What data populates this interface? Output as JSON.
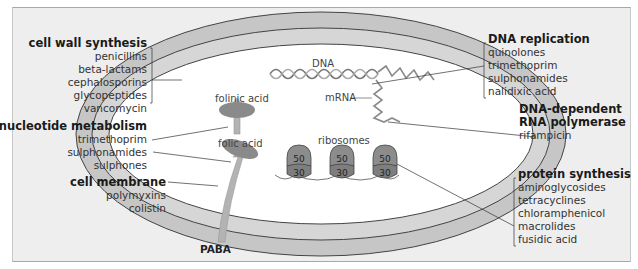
{
  "diagram": {
    "cell_labels": {
      "dna": "DNA",
      "mrna": "mRNA",
      "ribosomes": "ribosomes",
      "folinic_acid": "folinic acid",
      "folic_acid": "folic acid",
      "paba": "PABA",
      "ribosome_large_subunit": "50",
      "ribosome_small_subunit": "30"
    },
    "groups": {
      "cell_wall": {
        "heading": "cell wall synthesis",
        "drugs": [
          "penicillins",
          "beta-lactams",
          "cephalosporins",
          "glycopeptides",
          "vancomycin"
        ]
      },
      "nucleotide": {
        "heading": "nucleotide metabolism",
        "drugs": [
          "trimethoprim",
          "sulphonamides",
          "sulphones"
        ]
      },
      "membrane": {
        "heading": "cell membrane",
        "drugs": [
          "polymyxins",
          "colistin"
        ]
      },
      "dna_replication": {
        "heading": "DNA replication",
        "drugs": [
          "quinolones",
          "trimethoprim",
          "sulphonamides",
          "nalidixic acid"
        ]
      },
      "rna_polymerase": {
        "heading_line1": "DNA-dependent",
        "heading_line2": "RNA polymerase",
        "drugs": [
          "rifampicin"
        ]
      },
      "protein": {
        "heading": "protein synthesis",
        "drugs": [
          "aminoglycosides",
          "tetracyclines",
          "chloramphenicol",
          "macrolides",
          "fusidic acid"
        ]
      }
    },
    "colors": {
      "panel_bg": "#eeeeee",
      "wall_fill": "#c6c6c6",
      "membrane_fill": "#d9d9d9",
      "cytoplasm": "#ffffff",
      "enzyme_fill": "#8a8a8a",
      "ribosome_fill": "#8c8c8c",
      "arrow_fill": "#b5b5b5"
    }
  }
}
